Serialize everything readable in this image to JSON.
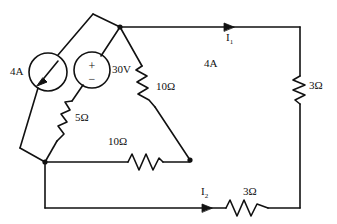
{
  "diagram": {
    "background_color": "#ffffff",
    "line_color": "#111111"
  },
  "sources": [
    {
      "id": "current-source",
      "kind": "current-source",
      "label": "4A",
      "symbol": "arrow-in-circle",
      "label_x": 10,
      "label_y": 72
    },
    {
      "id": "voltage-source",
      "kind": "voltage-source",
      "label": "30V",
      "plus": "+",
      "minus": "−",
      "label_x": 105,
      "label_y": 71
    }
  ],
  "resistors": [
    {
      "id": "r-5ohm",
      "label": "5Ω",
      "orientation": "diagonal",
      "label_x": 75,
      "label_y": 118
    },
    {
      "id": "r-10ohm-diagonal",
      "label": "10Ω",
      "orientation": "diagonal",
      "label_x": 158,
      "label_y": 88
    },
    {
      "id": "r-10ohm-bottom",
      "label": "10Ω",
      "orientation": "horizontal",
      "label_x": 110,
      "label_y": 143
    },
    {
      "id": "r-3ohm-right",
      "label": "3Ω",
      "orientation": "vertical",
      "label_x": 309,
      "label_y": 86
    },
    {
      "id": "r-3ohm-bottom",
      "label": "3Ω",
      "orientation": "horizontal",
      "label_x": 245,
      "label_y": 193
    }
  ],
  "currents": [
    {
      "id": "current-i1",
      "label": "I",
      "subscript": "1",
      "label_x": 226,
      "label_y": 36
    },
    {
      "id": "current-i2",
      "label": "I",
      "subscript": "2",
      "label_x": 202,
      "label_y": 190
    }
  ],
  "annotations": [
    {
      "id": "mesh-current-4a",
      "label": "4A",
      "label_x": 205,
      "label_y": 63
    }
  ]
}
